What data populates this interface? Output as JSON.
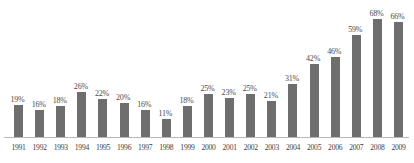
{
  "chart_data": {
    "type": "bar",
    "title": "",
    "subtitle": "",
    "xlabel": "",
    "ylabel": "",
    "ylim": [
      0,
      72
    ],
    "grid": false,
    "legend": false,
    "bar_color": "#6e6e6e",
    "axis_color": "#b9b9b9",
    "label_color": "#4a4a4a",
    "value_suffix": "%",
    "categories": [
      "1991",
      "1992",
      "1993",
      "1994",
      "1995",
      "1996",
      "1997",
      "1998",
      "1999",
      "2000",
      "2001",
      "2002",
      "2003",
      "2004",
      "2005",
      "2006",
      "2007",
      "2008",
      "2009"
    ],
    "values": [
      19,
      16,
      18,
      26,
      22,
      20,
      16,
      11,
      18,
      25,
      23,
      25,
      21,
      31,
      42,
      46,
      59,
      68,
      66
    ],
    "value_labels": [
      "19%",
      "16%",
      "18%",
      "26%",
      "22%",
      "20%",
      "16%",
      "11%",
      "18%",
      "25%",
      "23%",
      "25%",
      "21%",
      "31%",
      "42%",
      "46%",
      "59%",
      "68%",
      "66%"
    ]
  }
}
